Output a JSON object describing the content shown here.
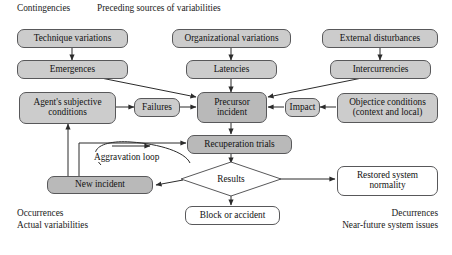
{
  "figure": {
    "headers": {
      "contingencies": "Contingencies",
      "preceding_sources": "Preceding sources of variabilities"
    },
    "footers": {
      "occurrences": "Occurrences",
      "actual_variabilities": "Actual variabilities",
      "decurrences": "Decurrences",
      "near_future": "Near-future system issues"
    },
    "loop_label": "Aggravation loop",
    "colors": {
      "box_fill_gray": "#cccccc",
      "box_fill_dark": "#b9b9b9",
      "box_fill_white": "#ffffff",
      "stroke": "#58585a",
      "arrow": "#2b2b2b",
      "text": "#121212",
      "background": "#ffffff"
    }
  },
  "nodes": {
    "technique_variations": "Technique variations",
    "emergences": "Emergences",
    "organizational_variations": "Organizational variations",
    "latencies": "Latencies",
    "external_disturbances": "External disturbances",
    "intercurrencies": "Intercurrencies",
    "agents_subjective_conditions_line1": "Agent's subjective",
    "agents_subjective_conditions_line2": "conditions",
    "failures": "Failures",
    "precursor_incident_line1": "Precursor",
    "precursor_incident_line2": "incident",
    "impact": "Impact",
    "objective_conditions_line1": "Objectice conditions",
    "objective_conditions_line2": "(context and local)",
    "recuperation_trials": "Recuperation trials",
    "new_incident": "New incident",
    "results": "Results",
    "block_or_accident": "Block or accident",
    "restored_system_normality_line1": "Restored system",
    "restored_system_normality_line2": "normality"
  }
}
